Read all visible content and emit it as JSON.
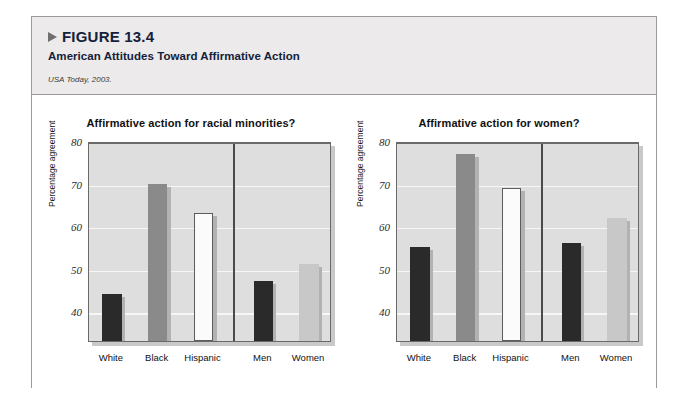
{
  "figure": {
    "number_label": "FIGURE 13.4",
    "title": "American Attitudes Toward Affirmative Action",
    "source": "USA Today, 2003.",
    "triangle_icon": "triangle-right-icon"
  },
  "colors": {
    "panel_background": "#eceaea",
    "plot_background": "#dedede",
    "gridline": "#f6f6f6",
    "axis": "#6a6a6a",
    "bar_dark": "#2a2a2a",
    "bar_medium": "#8a8a8a",
    "bar_white": "#fbfbfb",
    "bar_light": "#c8c8c8",
    "shadow": "#b2b2b2",
    "title_navy": "#14213a"
  },
  "chart_data": [
    {
      "type": "bar",
      "title": "Affirmative action for racial minorities?",
      "xlabel": "",
      "ylabel": "Percentage agreement",
      "categories": [
        "White",
        "Black",
        "Hispanic",
        "Men",
        "Women"
      ],
      "values": [
        44,
        70,
        63,
        47,
        51
      ],
      "bar_styles": [
        "dark",
        "medium",
        "white",
        "dark",
        "light"
      ],
      "group_split_after": 3,
      "ylim": [
        33,
        80
      ],
      "yticks": [
        40,
        50,
        60,
        70,
        80
      ],
      "grid": true,
      "legend": "none"
    },
    {
      "type": "bar",
      "title": "Affirmative action for women?",
      "xlabel": "",
      "ylabel": "Percentage agreement",
      "categories": [
        "White",
        "Black",
        "Hispanic",
        "Men",
        "Women"
      ],
      "values": [
        55,
        77,
        69,
        56,
        62
      ],
      "bar_styles": [
        "dark",
        "medium",
        "white",
        "dark",
        "light"
      ],
      "group_split_after": 3,
      "ylim": [
        33,
        80
      ],
      "yticks": [
        40,
        50,
        60,
        70,
        80
      ],
      "grid": true,
      "legend": "none"
    }
  ]
}
